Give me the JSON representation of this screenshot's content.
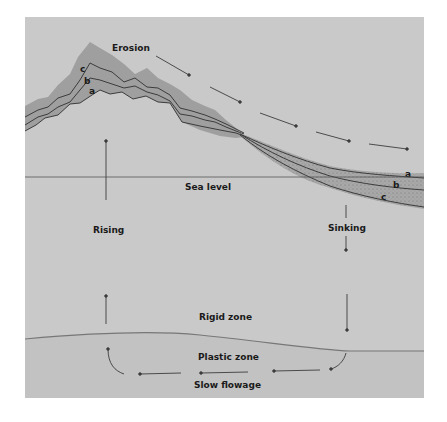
{
  "diagram": {
    "labels": {
      "erosion": "Erosion",
      "sea_level": "Sea level",
      "rising": "Rising",
      "sinking": "Sinking",
      "rigid_zone": "Rigid zone",
      "plastic_zone": "Plastic zone",
      "slow_flowage": "Slow flowage"
    },
    "layers_mountain": [
      "c",
      "b",
      "a"
    ],
    "layers_basin": [
      "a",
      "b",
      "c"
    ],
    "colors": {
      "background": "#ffffff",
      "crust": "#c8c8c8",
      "plastic": "#c4c4c4",
      "layer_fill": "#a9a9a9",
      "line": "#3c3c3c"
    }
  }
}
